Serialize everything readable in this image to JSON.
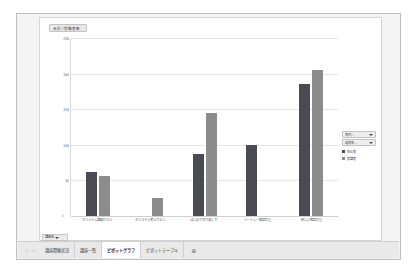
{
  "window": {
    "name": "excel-pivot-chart-sheet"
  },
  "chart": {
    "field_button_label": "合計 / 受験者数",
    "legend_filter_series": "系列...",
    "legend_filter_axis": "項目名...",
    "sheet_field_button": "講座名"
  },
  "legend": {
    "entries": [
      {
        "label": "申込者",
        "color": "#4a4a52"
      },
      {
        "label": "受講者",
        "color": "#8c8c8c"
      }
    ]
  },
  "chart_data": {
    "type": "bar",
    "title": "合計 / 受験者数",
    "xlabel": "",
    "ylabel": "",
    "ylim": [
      0,
      250
    ],
    "yticks": [
      0,
      50,
      100,
      150,
      200,
      250
    ],
    "grid": true,
    "legend_position": "right",
    "categories": [
      "オリジナル講座ひとつ",
      "オリジナル考えひとつ",
      "はじめて作り直しで",
      "ベートレー教室の里",
      "新しい教室の里"
    ],
    "series": [
      {
        "name": "申込者",
        "color": "#4a4a52",
        "values": [
          62,
          0,
          87,
          100,
          185
        ]
      },
      {
        "name": "受講者",
        "color": "#8c8c8c",
        "values": [
          56,
          26,
          145,
          0,
          205
        ]
      }
    ]
  },
  "tabs": {
    "nav_prev": "‹",
    "nav_next": "›",
    "items": [
      {
        "label": "講座開催状況",
        "active": false
      },
      {
        "label": "講座一覧",
        "active": false
      },
      {
        "label": "ピボットグラフ",
        "active": true
      },
      {
        "label": "ピボットテーブル",
        "active": false
      }
    ],
    "add_label": "⊕"
  }
}
